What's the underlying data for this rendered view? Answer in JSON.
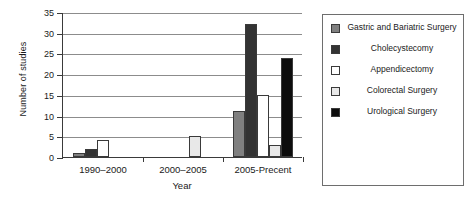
{
  "chart_data": {
    "type": "bar",
    "title": "",
    "xlabel": "Year",
    "ylabel": "Number of studies",
    "categories": [
      "1990–2000",
      "2000–2005",
      "2005-Precent"
    ],
    "ylim": [
      0,
      35
    ],
    "yticks": [
      0,
      5,
      10,
      15,
      20,
      25,
      30,
      35
    ],
    "grid": true,
    "legend_position": "right",
    "series": [
      {
        "name": "Gastric and Bariatric Surgery",
        "color": "#808080",
        "values": [
          1,
          0,
          11
        ]
      },
      {
        "name": "Cholecystecomy",
        "color": "#333333",
        "values": [
          2,
          0,
          32
        ]
      },
      {
        "name": "Appendicectomy",
        "color": "#ffffff",
        "values": [
          4,
          0,
          15
        ]
      },
      {
        "name": "Colorectal Surgery",
        "color": "#e8e8e8",
        "values": [
          0,
          5,
          3
        ]
      },
      {
        "name": "Urological Surgery",
        "color": "#0d0d0d",
        "values": [
          0,
          0,
          24
        ]
      }
    ]
  },
  "axis": {
    "y_title": "Number of studies",
    "x_title": "Year",
    "y_tick_labels": [
      "0",
      "5",
      "10",
      "15",
      "20",
      "25",
      "30",
      "35"
    ],
    "x_tick_labels": [
      "1990–2000",
      "2000–2005",
      "2005-Precent"
    ]
  },
  "legend": {
    "items": [
      {
        "label": "Gastric and Bariatric Surgery",
        "color": "#808080"
      },
      {
        "label": "Cholecystecomy",
        "color": "#333333"
      },
      {
        "label": "Appendicectomy",
        "color": "#ffffff"
      },
      {
        "label": "Colorectal Surgery",
        "color": "#e8e8e8"
      },
      {
        "label": "Urological Surgery",
        "color": "#0d0d0d"
      }
    ]
  }
}
